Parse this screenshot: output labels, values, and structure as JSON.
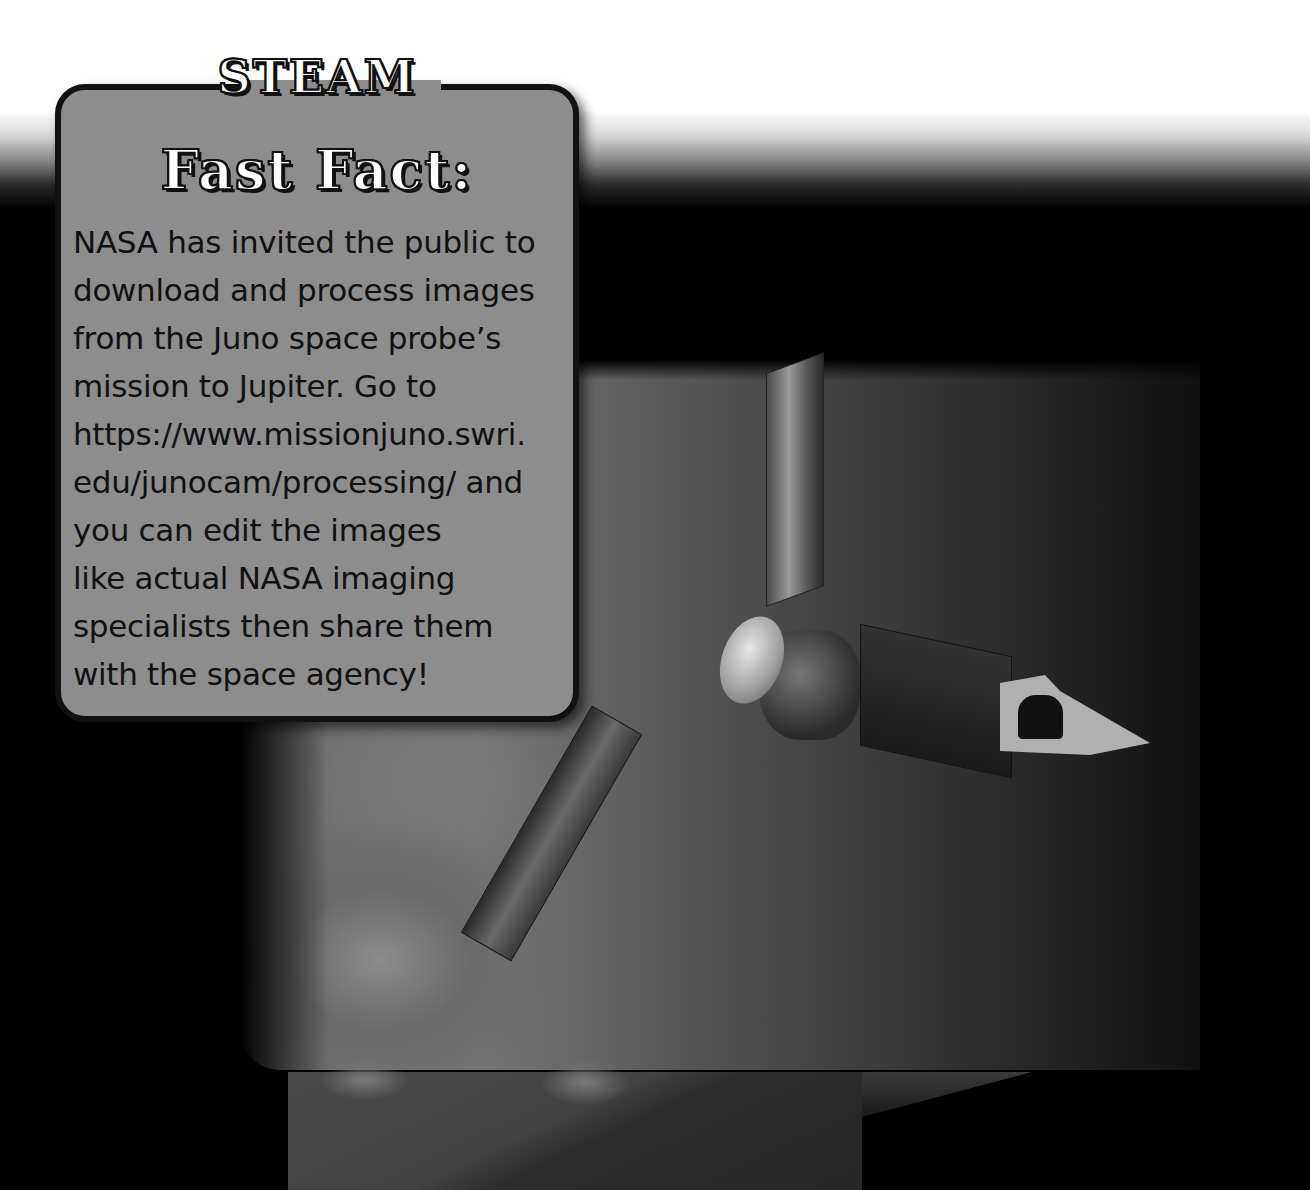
{
  "fact_box": {
    "title_line1": "STEAM",
    "title_line2": "Fast Fact:",
    "lines": [
      "NASA has invited the public to",
      "download and process images",
      "from the Juno space probe’s",
      "mission to Jupiter. Go to",
      "https://www.missionjuno.swri.",
      "edu/junocam/processing/ and",
      "you can edit the images",
      "like actual NASA imaging",
      "specialists then share them",
      "with the space agency!"
    ]
  },
  "image": {
    "subject": "juno-spacecraft-over-jupiter"
  },
  "colors": {
    "box_fill": "#8d8d8d",
    "box_border": "#111111",
    "background": "#000000"
  }
}
